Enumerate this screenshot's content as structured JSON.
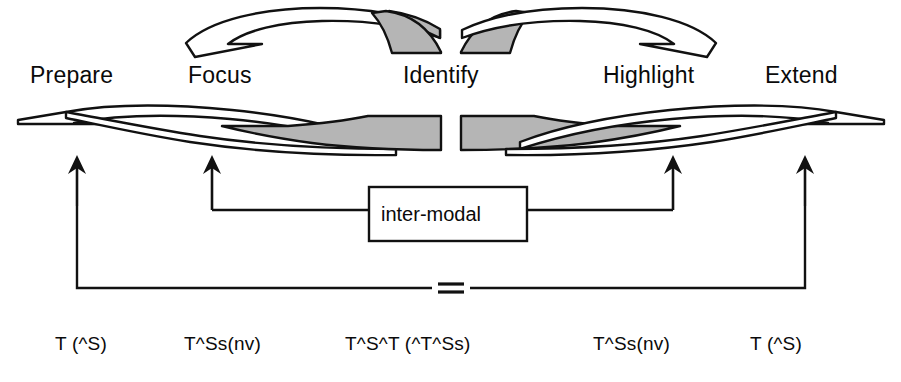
{
  "diagram": {
    "colors": {
      "stroke": "#111111",
      "shade_fill": "#b5b5b5",
      "white_fill": "#ffffff",
      "background": "#ffffff",
      "text": "#0a0a0a"
    },
    "stage_labels": [
      {
        "id": "prepare",
        "text": "Prepare",
        "x": 30,
        "y": 62
      },
      {
        "id": "focus",
        "text": "Focus",
        "x": 188,
        "y": 62
      },
      {
        "id": "identify",
        "text": "Identify",
        "x": 403,
        "y": 62
      },
      {
        "id": "highlight",
        "text": "Highlight",
        "x": 603,
        "y": 62
      },
      {
        "id": "extend",
        "text": "Extend",
        "x": 765,
        "y": 62
      }
    ],
    "inter_modal_box": {
      "label": "inter-modal",
      "x": 369,
      "y": 187,
      "width": 158,
      "height": 54
    },
    "equals_sign": {
      "text": "=",
      "x": 440,
      "y": 272
    },
    "formula_labels": [
      {
        "id": "f-prepare",
        "text": "T (^S)",
        "x": 55,
        "y": 333
      },
      {
        "id": "f-focus",
        "text": "T^Ss(nv)",
        "x": 184,
        "y": 333
      },
      {
        "id": "f-identify",
        "text": "T^S^T (^T^Ss)",
        "x": 345,
        "y": 333
      },
      {
        "id": "f-highlight",
        "text": "T^Ss(nv)",
        "x": 593,
        "y": 333
      },
      {
        "id": "f-extend",
        "text": "T (^S)",
        "x": 750,
        "y": 333
      }
    ],
    "arrows": [
      {
        "id": "arrow-prepare",
        "x": 77,
        "tip_y": 157,
        "tail_y": 206
      },
      {
        "id": "arrow-focus",
        "x": 212,
        "tip_y": 157,
        "tail_y": 210
      },
      {
        "id": "arrow-highlight",
        "x": 673,
        "tip_y": 157,
        "tail_y": 210
      },
      {
        "id": "arrow-extend",
        "x": 805,
        "tip_y": 157,
        "tail_y": 206
      }
    ],
    "connectors": {
      "bracket_y": 288,
      "box_link_y": 210,
      "left_bracket_x": 77,
      "right_bracket_x": 805,
      "focus_link_x": 212,
      "highlight_link_x": 673
    },
    "swooshes": {
      "top_count": 2,
      "bottom_count": 2,
      "description": "paired curved arrow bands, outer halves white, inner halves shaded"
    }
  }
}
